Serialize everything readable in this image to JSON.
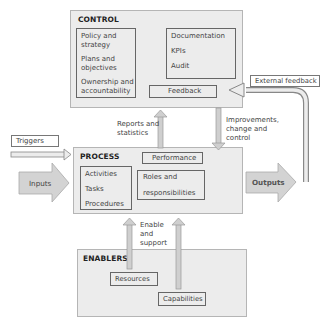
{
  "control": {
    "title": "CONTROL",
    "left_items": [
      "Policy and",
      "strategy",
      "Plans and",
      "objectives",
      "Ownership and",
      "accountability"
    ],
    "right_items": [
      "Documentation",
      "KPIs",
      "Audit"
    ],
    "feedback": "Feedback"
  },
  "process": {
    "title": "PROCESS",
    "left_items": [
      "Activities",
      "Tasks",
      "Procedures"
    ],
    "performance": "Performance",
    "roles": [
      "Roles and",
      "responsibilities"
    ]
  },
  "enablers": {
    "title": "ENABLERS",
    "resources": "Resources",
    "capabilities": "Capabilities"
  },
  "flows": {
    "external_feedback": "External feedback",
    "triggers": "Triggers",
    "inputs": "Inputs",
    "outputs": "Outputs",
    "reports": [
      "Reports and",
      "statistics"
    ],
    "improvements": [
      "Improvements,",
      "change and",
      "control"
    ],
    "enable": [
      "Enable",
      "and",
      "support"
    ]
  }
}
